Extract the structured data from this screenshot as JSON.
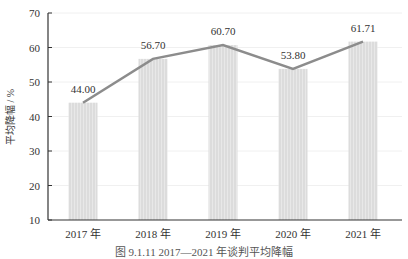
{
  "chart_data": {
    "type": "bar",
    "title": "",
    "caption": "图 9.1.11 2017—2021 年谈判平均降幅",
    "categories": [
      "2017 年",
      "2018 年",
      "2019 年",
      "2020 年",
      "2021 年"
    ],
    "series": [
      {
        "name": "平均降幅 (bar)",
        "type": "bar",
        "values": [
          44.0,
          56.7,
          60.7,
          53.8,
          61.71
        ]
      },
      {
        "name": "平均降幅 (line)",
        "type": "line",
        "values": [
          44.0,
          56.7,
          60.7,
          53.8,
          61.71
        ]
      }
    ],
    "data_labels": [
      "44.00",
      "56.70",
      "60.70",
      "53.80",
      "61.71"
    ],
    "xlabel": "",
    "ylabel": "平均降幅 / %",
    "ylim": [
      10,
      70
    ],
    "yticks": [
      10,
      20,
      30,
      40,
      50,
      60,
      70
    ],
    "grid": true,
    "legend": "none",
    "colors": {
      "bar": "#dcdcdc",
      "line": "#8c8c8c",
      "axis": "#333333",
      "grid": "#f0f0f0"
    }
  }
}
